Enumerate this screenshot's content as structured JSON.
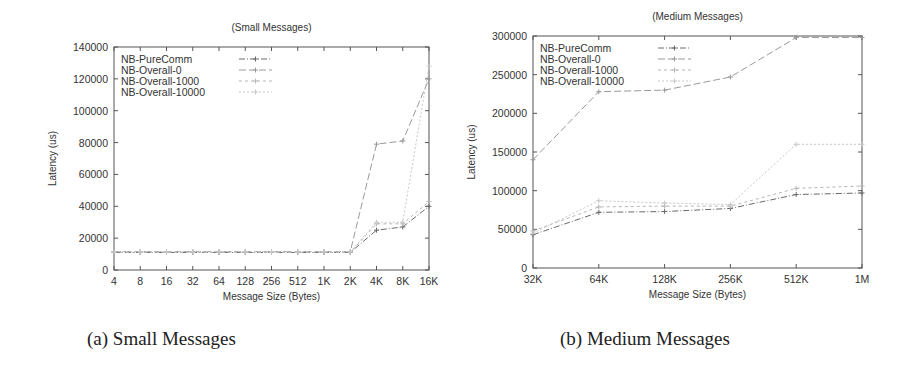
{
  "captions": {
    "a": "(a) Small Messages",
    "b": "(b) Medium Messages"
  },
  "chart_data": [
    {
      "type": "line",
      "title": "(Small Messages)",
      "xlabel": "Message Size (Bytes)",
      "ylabel": "Latency (us)",
      "categories": [
        "4",
        "8",
        "16",
        "32",
        "64",
        "128",
        "256",
        "512",
        "1K",
        "2K",
        "4K",
        "8K",
        "16K"
      ],
      "yticks": [
        "0",
        "20000",
        "40000",
        "60000",
        "80000",
        "100000",
        "120000",
        "140000"
      ],
      "ylim": [
        0,
        140000
      ],
      "grid": false,
      "legend_position": "top-left",
      "series": [
        {
          "name": "NB-PureComm",
          "values": [
            11000,
            11000,
            11000,
            11000,
            11000,
            11000,
            11000,
            11000,
            11000,
            11000,
            25000,
            27000,
            40000
          ]
        },
        {
          "name": "NB-Overall-0",
          "values": [
            11500,
            11500,
            11500,
            11500,
            11500,
            11500,
            11500,
            11500,
            11500,
            11500,
            79000,
            81000,
            120000
          ]
        },
        {
          "name": "NB-Overall-1000",
          "values": [
            11000,
            11000,
            11000,
            11000,
            11000,
            11000,
            11000,
            11000,
            11000,
            11000,
            29000,
            29000,
            43000
          ]
        },
        {
          "name": "NB-Overall-10000",
          "values": [
            11500,
            11500,
            11500,
            11500,
            11500,
            11500,
            11500,
            11500,
            11500,
            11500,
            30000,
            30000,
            128000
          ]
        }
      ]
    },
    {
      "type": "line",
      "title": "(Medium Messages)",
      "xlabel": "Message Size (Bytes)",
      "ylabel": "Latency (us)",
      "categories": [
        "32K",
        "64K",
        "128K",
        "256K",
        "512K",
        "1M"
      ],
      "yticks": [
        "0",
        "50000",
        "100000",
        "150000",
        "200000",
        "250000",
        "300000"
      ],
      "ylim": [
        0,
        300000
      ],
      "grid": false,
      "legend_position": "top-left",
      "series": [
        {
          "name": "NB-PureComm",
          "values": [
            43000,
            72000,
            73000,
            77000,
            95000,
            97000
          ]
        },
        {
          "name": "NB-Overall-0",
          "values": [
            140000,
            228000,
            230000,
            247000,
            298000,
            298000
          ]
        },
        {
          "name": "NB-Overall-1000",
          "values": [
            48000,
            79000,
            80000,
            80000,
            103000,
            106000
          ]
        },
        {
          "name": "NB-Overall-10000",
          "values": [
            45000,
            87000,
            84000,
            82000,
            160000,
            160000
          ]
        }
      ]
    }
  ],
  "styles": {
    "axis_color": "#555555",
    "series_colors": [
      "#6a6a6a",
      "#9a9a9a",
      "#b5b5b5",
      "#c8c8c8"
    ],
    "series_dashes": [
      "6,2,1,2",
      "7,3",
      "3,3",
      "2,2"
    ]
  }
}
